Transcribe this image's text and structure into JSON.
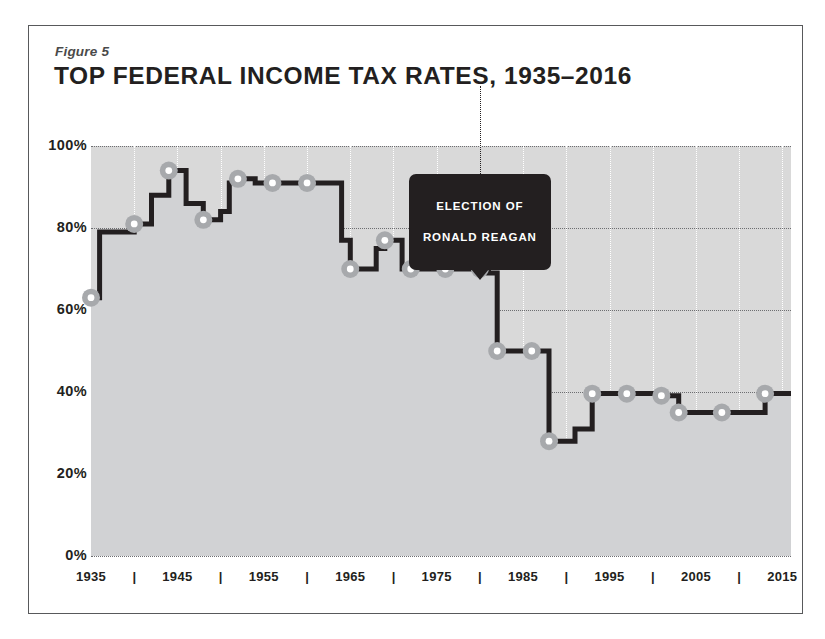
{
  "figure": {
    "label": "Figure 5",
    "title": "TOP FEDERAL INCOME TAX RATES, 1935–2016"
  },
  "annotation": {
    "text": "ELECTION OF\nRONALD REAGAN",
    "line1": "ELECTION OF",
    "line2": "RONALD REAGAN",
    "at_year": 1980
  },
  "colors": {
    "plot_background": "#d9d9d9",
    "line": "#231f20",
    "marker_fill": "#ffffff",
    "marker_ring": "#a7a9ac",
    "gridline": "#6d6e71",
    "vgridline": "#ffffff",
    "border": "#58595b",
    "callout_background": "#231f20",
    "callout_text": "#ffffff"
  },
  "chart_data": {
    "type": "line",
    "title": "TOP FEDERAL INCOME TAX RATES, 1935–2016",
    "xlabel": "",
    "ylabel": "",
    "xlim": [
      1935,
      2016
    ],
    "ylim": [
      0,
      100
    ],
    "grid": true,
    "legend": null,
    "ytick_labels": [
      "0%",
      "20%",
      "40%",
      "60%",
      "80%",
      "100%"
    ],
    "ytick_values": [
      0,
      20,
      40,
      60,
      80,
      100
    ],
    "xtick_labels": [
      "1935",
      "|",
      "1945",
      "|",
      "1955",
      "|",
      "1965",
      "|",
      "1975",
      "|",
      "1985",
      "|",
      "1995",
      "|",
      "2005",
      "|",
      "2015"
    ],
    "xtick_values": [
      1935,
      1940,
      1945,
      1950,
      1955,
      1960,
      1965,
      1970,
      1975,
      1980,
      1985,
      1990,
      1995,
      2000,
      2005,
      2010,
      2015
    ],
    "x": [
      1935,
      1936,
      1940,
      1941,
      1942,
      1944,
      1946,
      1948,
      1950,
      1951,
      1952,
      1954,
      1964,
      1965,
      1968,
      1969,
      1971,
      1976,
      1981,
      1982,
      1986,
      1988,
      1991,
      1993,
      2001,
      2003,
      2013
    ],
    "values": [
      63,
      79,
      81,
      81,
      88,
      94,
      86,
      82,
      84,
      91,
      92,
      91,
      77,
      70,
      75,
      77,
      70,
      70,
      69,
      50,
      50,
      28,
      31,
      39.6,
      39.1,
      35,
      39.6
    ],
    "markers": [
      {
        "year": 1935,
        "value": 63
      },
      {
        "year": 1940,
        "value": 81
      },
      {
        "year": 1944,
        "value": 94
      },
      {
        "year": 1948,
        "value": 82
      },
      {
        "year": 1952,
        "value": 92
      },
      {
        "year": 1956,
        "value": 91
      },
      {
        "year": 1960,
        "value": 91
      },
      {
        "year": 1965,
        "value": 70
      },
      {
        "year": 1969,
        "value": 77
      },
      {
        "year": 1972,
        "value": 70
      },
      {
        "year": 1976,
        "value": 70
      },
      {
        "year": 1980,
        "value": 70
      },
      {
        "year": 1982,
        "value": 50
      },
      {
        "year": 1986,
        "value": 50
      },
      {
        "year": 1988,
        "value": 28
      },
      {
        "year": 1993,
        "value": 39.6
      },
      {
        "year": 1997,
        "value": 39.6
      },
      {
        "year": 2001,
        "value": 39.1
      },
      {
        "year": 2003,
        "value": 35
      },
      {
        "year": 2008,
        "value": 35
      },
      {
        "year": 2013,
        "value": 39.6
      }
    ]
  }
}
